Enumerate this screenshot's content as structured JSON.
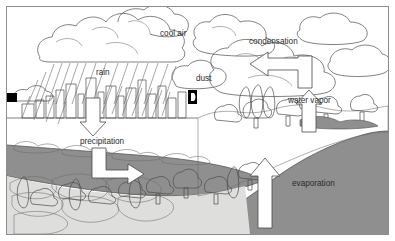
{
  "diagram": {
    "labels": [
      {
        "id": "cool-air",
        "text": "cool air",
        "x": 160,
        "y": 36
      },
      {
        "id": "condensation",
        "text": "condensation",
        "x": 249,
        "y": 44
      },
      {
        "id": "rain",
        "text": "rain",
        "x": 96,
        "y": 75
      },
      {
        "id": "dust",
        "text": "dust",
        "x": 196,
        "y": 81
      },
      {
        "id": "water-vapor",
        "text": "water vapor",
        "x": 288,
        "y": 103
      },
      {
        "id": "precipitation",
        "text": "precipitation",
        "x": 80,
        "y": 144
      },
      {
        "id": "evaporation",
        "text": "evaporation",
        "x": 292,
        "y": 186
      }
    ],
    "arrows": [
      {
        "id": "precipitation-down-arrow",
        "direction": "down",
        "label": "precipitation"
      },
      {
        "id": "runoff-elbow-arrow",
        "direction": "down-right",
        "label": "precipitation"
      },
      {
        "id": "condensation-elbow-arrow",
        "direction": "up-left",
        "label": "condensation"
      },
      {
        "id": "water-vapor-up-arrow",
        "direction": "up",
        "label": "water vapor"
      },
      {
        "id": "evaporation-up-arrow",
        "direction": "up",
        "label": "evaporation"
      }
    ],
    "colors": {
      "outline": "#4a4a4a",
      "water": "#8f8f8f",
      "groundwater": "#8f8f8f",
      "bedrock": "#dededc",
      "arrow_fill": "#ffffff",
      "background": "#ffffff",
      "frame": "#8c8c8c",
      "marker": "#000000"
    },
    "regions": [
      {
        "id": "sky",
        "name": "sky-with-clouds"
      },
      {
        "id": "city",
        "name": "city-skyline-with-rain"
      },
      {
        "id": "groundwater",
        "name": "groundwater-band"
      },
      {
        "id": "bedrock",
        "name": "bedrock-layer"
      },
      {
        "id": "water-body",
        "name": "lake-ocean"
      },
      {
        "id": "vegetation",
        "name": "trees-and-shrubs"
      }
    ]
  }
}
